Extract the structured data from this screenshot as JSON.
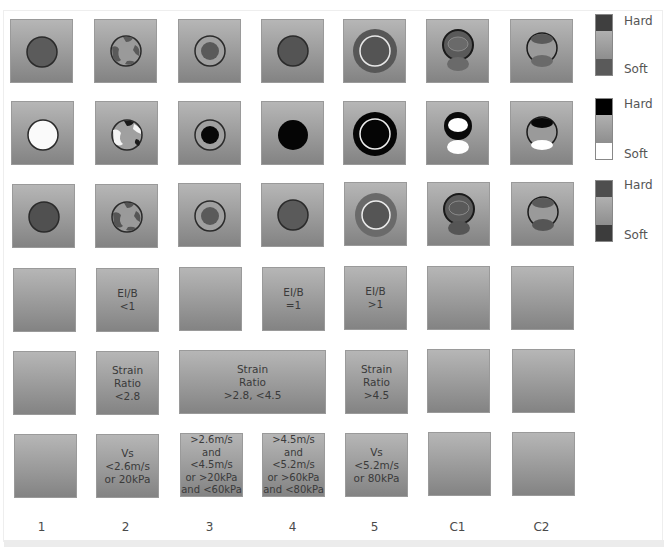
{
  "figure": {
    "columns": [
      "1",
      "2",
      "3",
      "4",
      "5",
      "C1",
      "C2"
    ],
    "rows": [
      {
        "name": "elastography-row-1",
        "legend": {
          "top": "Hard",
          "bottom": "Soft",
          "top_color": "#3f3f3f",
          "mid_color": "#a4a4a4",
          "bottom_color": "#5a5a5a"
        }
      },
      {
        "name": "elastography-row-2",
        "legend": {
          "top": "Hard",
          "bottom": "Soft",
          "top_color": "#000000",
          "mid_color": "#a4a4a4",
          "bottom_color": "#ffffff"
        }
      },
      {
        "name": "elastography-row-3",
        "legend": {
          "top": "Hard",
          "bottom": "Soft",
          "top_color": "#4e4e4e",
          "mid_color": "#a4a4a4",
          "bottom_color": "#3c3c3c"
        }
      }
    ],
    "criteria": {
      "elb": [
        "",
        "EI/B\n<1",
        "",
        "EI/B\n=1",
        "EI/B\n>1",
        "",
        ""
      ],
      "strain_ratio": {
        "col1": "",
        "col2": "Strain\nRatio\n<2.8",
        "col34": "Strain\nRatio\n>2.8, <4.5",
        "col5": "Strain\nRatio\n>4.5",
        "c1": "",
        "c2": ""
      },
      "shear_wave": [
        "",
        "Vs\n<2.6m/s\nor 20kPa",
        ">2.6m/s\nand <4.5m/s\nor >20kPa\nand <60kPa",
        ">4.5m/s\nand <5.2m/s\nor >60kPa\nand <80kPa",
        "Vs\n<5.2m/s\nor 80kPa",
        "",
        ""
      ]
    },
    "colors": {
      "background": "#ffffff",
      "cell_top": "#b6b6b6",
      "cell_bottom": "#838383",
      "text": "#3a3a3a"
    }
  }
}
